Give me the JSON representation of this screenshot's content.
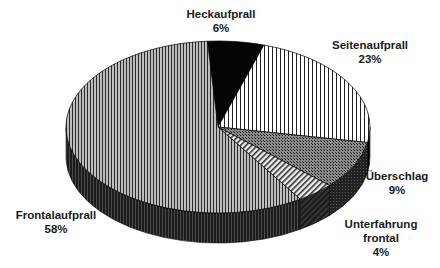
{
  "chart_data": {
    "type": "pie",
    "style": "3d-exploded-none",
    "title": "",
    "unit": "%",
    "start_angle_deg": -94,
    "direction": "clockwise",
    "slices": [
      {
        "label": "Heckaufprall",
        "value": 6,
        "display": "6%",
        "pattern": "solid-black"
      },
      {
        "label": "Seitenaufprall",
        "value": 23,
        "display": "23%",
        "pattern": "wide-vertical-stripes"
      },
      {
        "label": "Überschlag",
        "value": 9,
        "display": "9%",
        "pattern": "crosshatch"
      },
      {
        "label": "Unterfahrung frontal",
        "value": 4,
        "display": "4%",
        "pattern": "diagonal-stripes"
      },
      {
        "label": "Frontalaufprall",
        "value": 58,
        "display": "58%",
        "pattern": "fine-vertical-stripes"
      }
    ],
    "legend": "none (data labels outside slices)"
  },
  "labels": {
    "heck": {
      "name": "Heckaufprall",
      "pct": "6%"
    },
    "seite": {
      "name": "Seitenaufprall",
      "pct": "23%"
    },
    "ueberschlag": {
      "name": "Überschlag",
      "pct": "9%"
    },
    "unterfahrung": {
      "line1": "Unterfahrung",
      "line2": "frontal",
      "pct": "4%"
    },
    "frontal": {
      "name": "Frontalaufprall",
      "pct": "58%"
    }
  },
  "geometry": {
    "cx": 218,
    "cy": 127,
    "rx": 152,
    "ry": 86,
    "depth": 30
  }
}
